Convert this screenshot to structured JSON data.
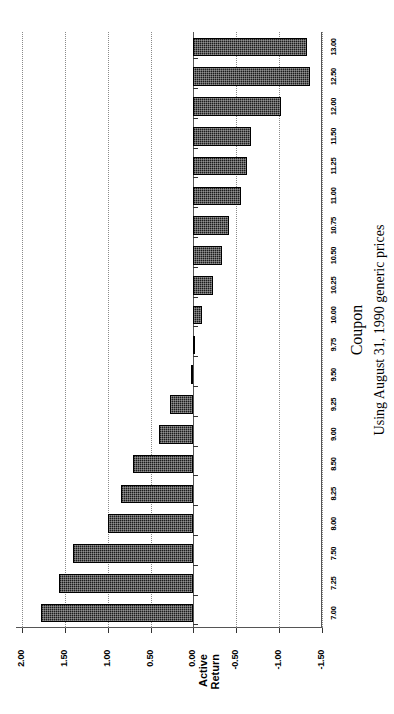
{
  "chart_data": {
    "type": "bar",
    "orientation": "vertical",
    "title": "",
    "xlabel": "Coupon",
    "ylabel": "Active Return",
    "footnote": "Using August 31, 1990 generic prices",
    "ylim": [
      -1.5,
      2.0
    ],
    "yticks": [
      "2.00",
      "1.50",
      "1.00",
      "0.50",
      "0.00",
      "-0.50",
      "-1.00",
      "-1.50"
    ],
    "ytick_values": [
      2.0,
      1.5,
      1.0,
      0.5,
      0.0,
      -0.5,
      -1.0,
      -1.5
    ],
    "grid": true,
    "legend": "none",
    "bar_color": "#1c1c1c",
    "categories": [
      "7.00",
      "7.25",
      "7.50",
      "8.00",
      "8.25",
      "8.50",
      "9.00",
      "9.25",
      "9.50",
      "9.75",
      "10.00",
      "10.25",
      "10.50",
      "10.75",
      "11.00",
      "11.25",
      "11.50",
      "12.00",
      "12.50",
      "13.00"
    ],
    "values": [
      1.78,
      1.57,
      1.4,
      1.0,
      0.85,
      0.7,
      0.4,
      0.27,
      0.03,
      -0.02,
      -0.1,
      -0.23,
      -0.33,
      -0.42,
      -0.55,
      -0.62,
      -0.67,
      -1.02,
      -1.36,
      -1.33
    ]
  }
}
